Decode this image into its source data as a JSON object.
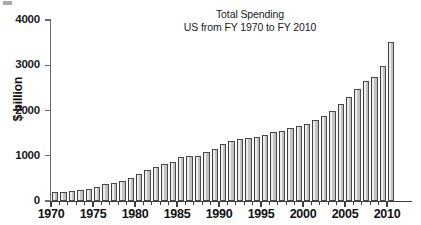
{
  "figure": {
    "artifact_name": "scan-artifact"
  },
  "chart_data": {
    "type": "bar",
    "title": "Total Spending",
    "subtitle": "US from FY 1970 to FY 2010",
    "xlabel": "",
    "ylabel": "$ billion",
    "ylim": [
      0,
      4000
    ],
    "xlim": [
      1969.4,
      2010.6
    ],
    "grid": false,
    "legend": null,
    "ytick_labels": [
      "0",
      "1000",
      "2000",
      "3000",
      "4000"
    ],
    "yticks": [
      0,
      1000,
      2000,
      3000,
      4000
    ],
    "xtick_labels": [
      "1970",
      "1975",
      "1980",
      "1985",
      "1990",
      "1995",
      "2000",
      "2005",
      "2010"
    ],
    "xticks": [
      1970,
      1975,
      1980,
      1985,
      1990,
      1995,
      2000,
      2005,
      2010
    ],
    "categories": [
      "1970",
      "1971",
      "1972",
      "1973",
      "1974",
      "1975",
      "1976",
      "1977",
      "1978",
      "1979",
      "1980",
      "1981",
      "1982",
      "1983",
      "1984",
      "1985",
      "1986",
      "1987",
      "1988",
      "1989",
      "1990",
      "1991",
      "1992",
      "1993",
      "1994",
      "1995",
      "1996",
      "1997",
      "1998",
      "1999",
      "2000",
      "2001",
      "2002",
      "2003",
      "2004",
      "2005",
      "2006",
      "2007",
      "2008",
      "2009",
      "2010"
    ],
    "values": [
      195,
      195,
      225,
      245,
      265,
      320,
      365,
      400,
      450,
      500,
      600,
      680,
      760,
      810,
      860,
      975,
      1000,
      1000,
      1080,
      1160,
      1250,
      1330,
      1360,
      1385,
      1405,
      1450,
      1520,
      1550,
      1610,
      1660,
      1710,
      1790,
      1880,
      2000,
      2150,
      2300,
      2480,
      2650,
      2730,
      2990,
      3520
    ],
    "values_note": "$ billion, US total spending by fiscal year",
    "series_name": "Total Spending",
    "bar_fill_color": "#c6c6c6",
    "bar_edge_color": "#4a4a4a",
    "axis_color": "#3d3d3d",
    "background_color": "#ffffff"
  }
}
